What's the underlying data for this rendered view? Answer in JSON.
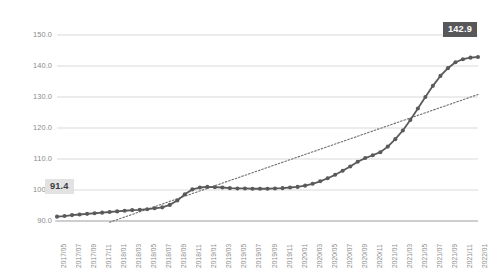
{
  "chart_data": {
    "type": "line",
    "title": "",
    "subtitle": "",
    "xlabel": "",
    "ylabel": "",
    "ylim": [
      90.0,
      150.0
    ],
    "ytick_labels": [
      "150.0",
      "140.0",
      "130.0",
      "120.0",
      "110.0",
      "100.0",
      "90.0"
    ],
    "ytick_values": [
      150.0,
      140.0,
      130.0,
      120.0,
      110.0,
      100.0,
      90.0
    ],
    "grid": "horizontal",
    "legend": "none",
    "x": [
      "2017/05",
      "2017/06",
      "2017/07",
      "2017/08",
      "2017/09",
      "2017/10",
      "2017/11",
      "2017/12",
      "2018/01",
      "2018/02",
      "2018/03",
      "2018/04",
      "2018/05",
      "2018/06",
      "2018/07",
      "2018/08",
      "2018/09",
      "2018/10",
      "2018/11",
      "2018/12",
      "2019/01",
      "2019/02",
      "2019/03",
      "2019/04",
      "2019/05",
      "2019/06",
      "2019/07",
      "2019/08",
      "2019/09",
      "2019/10",
      "2019/11",
      "2019/12",
      "2020/01",
      "2020/02",
      "2020/03",
      "2020/04",
      "2020/05",
      "2020/06",
      "2020/07",
      "2020/08",
      "2020/09",
      "2020/10",
      "2020/11",
      "2020/12",
      "2021/01",
      "2021/02",
      "2021/03",
      "2021/04",
      "2021/05",
      "2021/06",
      "2021/07",
      "2021/08",
      "2021/09",
      "2021/10",
      "2021/11",
      "2021/12",
      "2022/01"
    ],
    "xtick_labels": [
      "2017/05",
      "2017/07",
      "2017/09",
      "2017/11",
      "2018/01",
      "2018/03",
      "2018/05",
      "2018/07",
      "2018/09",
      "2018/11",
      "2019/01",
      "2019/03",
      "2019/05",
      "2019/07",
      "2019/09",
      "2019/11",
      "2020/01",
      "2020/03",
      "2020/05",
      "2020/07",
      "2020/09",
      "2020/11",
      "2021/01",
      "2021/03",
      "2021/05",
      "2021/07",
      "2021/09",
      "2021/11",
      "2022/01"
    ],
    "xtick_step_months": 2,
    "series": [
      {
        "name": "index",
        "style": "line-with-markers",
        "color": "#5a5a5c",
        "values": [
          91.4,
          91.6,
          91.9,
          92.1,
          92.3,
          92.5,
          92.7,
          92.9,
          93.1,
          93.3,
          93.5,
          93.6,
          93.8,
          94.1,
          94.4,
          95.2,
          96.6,
          98.6,
          100.2,
          100.8,
          101.0,
          100.9,
          100.8,
          100.6,
          100.5,
          100.5,
          100.4,
          100.4,
          100.4,
          100.5,
          100.6,
          100.8,
          101.0,
          101.4,
          102.0,
          102.8,
          103.8,
          104.9,
          106.2,
          107.6,
          109.1,
          110.3,
          111.2,
          112.2,
          114.0,
          116.4,
          119.2,
          122.6,
          126.3,
          130.0,
          133.6,
          136.8,
          139.3,
          141.2,
          142.2,
          142.7,
          142.9
        ]
      },
      {
        "name": "trendline",
        "style": "dotted",
        "color": "#6e6e70",
        "start_x": "2017/12",
        "start_value": 89.6,
        "end_x": "2022/01",
        "end_value": 130.8
      }
    ],
    "annotations": [
      {
        "name": "start-value-label",
        "text": "91.4",
        "value": 91.4,
        "at_x": "2017/05",
        "style": "light-box"
      },
      {
        "name": "end-value-label",
        "text": "142.9",
        "value": 142.9,
        "at_x": "2022/01",
        "style": "dark-box"
      }
    ]
  },
  "colors": {
    "series": "#5a5a5c",
    "trendline": "#6e6e70",
    "grid": "#d9d9d9",
    "axis": "#b0b0b0",
    "tick_text": "#8a8a8a",
    "callout_start_bg": "#e2e2e2",
    "callout_start_text": "#3d3d3d",
    "callout_end_bg": "#58585a",
    "callout_end_text": "#ffffff"
  }
}
